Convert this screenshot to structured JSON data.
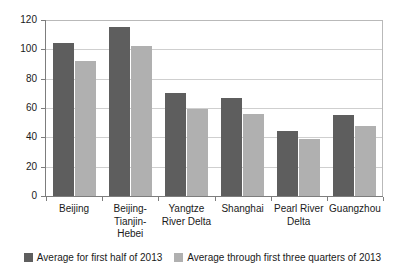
{
  "chart_data": {
    "type": "bar",
    "title": "",
    "subtitle": "",
    "xlabel": "",
    "ylabel": "",
    "ylim": [
      0,
      120
    ],
    "yticks": [
      0,
      20,
      40,
      60,
      80,
      100,
      120
    ],
    "ytick_labels": [
      "0",
      "20",
      "40",
      "60",
      "80",
      "100",
      "120"
    ],
    "grid": true,
    "legend_position": "bottom",
    "categories": [
      "Beijing",
      "Beijing-Tianjin-Hebei",
      "Yangtze River Delta",
      "Shanghai",
      "Pearl River Delta",
      "Guangzhou"
    ],
    "category_lines": [
      [
        "Beijing"
      ],
      [
        "Beijing-",
        "Tianjin-",
        "Hebei"
      ],
      [
        "Yangtze",
        "River Delta"
      ],
      [
        "Shanghai"
      ],
      [
        "Pearl River",
        "Delta"
      ],
      [
        "Guangzhou"
      ]
    ],
    "series": [
      {
        "name": "Average for first half of 2013",
        "color": "#5e5e5e",
        "values": [
          104,
          115,
          70,
          67,
          44,
          55
        ]
      },
      {
        "name": "Average through first three quarters of 2013",
        "color": "#b0b0b0",
        "values": [
          92,
          102,
          59,
          56,
          39,
          48
        ]
      }
    ]
  },
  "legend": {
    "items": [
      {
        "label": "Average for first half of 2013",
        "color": "#5e5e5e"
      },
      {
        "label": "Average through first three quarters of 2013",
        "color": "#b0b0b0"
      }
    ]
  },
  "colors": {
    "series_dark": "#5e5e5e",
    "series_light": "#b0b0b0",
    "gridline": "#cfcfcf",
    "axis": "#7d7d7d",
    "background": "#ffffff",
    "text": "#1a1a1a"
  }
}
